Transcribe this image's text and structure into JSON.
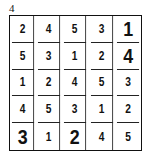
{
  "puzzle": {
    "label": "4",
    "size": 5,
    "rows": [
      [
        "2",
        "4",
        "5",
        "3",
        "1"
      ],
      [
        "5",
        "3",
        "1",
        "2",
        "4"
      ],
      [
        "1",
        "2",
        "4",
        "5",
        "3"
      ],
      [
        "4",
        "5",
        "3",
        "1",
        "2"
      ],
      [
        "3",
        "1",
        "2",
        "4",
        "5"
      ]
    ],
    "emphasized_cells": [
      [
        0,
        4
      ],
      [
        1,
        4
      ],
      [
        4,
        0
      ],
      [
        4,
        2
      ]
    ]
  }
}
